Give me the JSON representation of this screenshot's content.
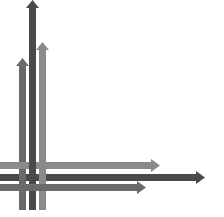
{
  "graphic": {
    "description": "Abstract arrows graphic: three vertical upward arrows crossing three horizontal rightward arrows",
    "colors": {
      "background": "#ffffff",
      "dark": "#4a4a4a",
      "mid": "#6e6e6e",
      "light": "#8c8c8c"
    },
    "vertical_arrows": [
      {
        "x": 19,
        "width": 7,
        "tip_y": 58,
        "bottom_y": 210,
        "color": "#6a6a6a"
      },
      {
        "x": 29,
        "width": 7,
        "tip_y": 0,
        "bottom_y": 210,
        "color": "#4a4a4a"
      },
      {
        "x": 39,
        "width": 7,
        "tip_y": 42,
        "bottom_y": 210,
        "color": "#8a8a8a"
      }
    ],
    "horizontal_arrows": [
      {
        "y": 162,
        "height": 7,
        "start_x": 0,
        "tip_x": 160,
        "color": "#8a8a8a"
      },
      {
        "y": 174,
        "height": 7,
        "start_x": 0,
        "tip_x": 205,
        "color": "#4a4a4a"
      },
      {
        "y": 184,
        "height": 7,
        "start_x": 0,
        "tip_x": 146,
        "color": "#6a6a6a"
      }
    ]
  }
}
